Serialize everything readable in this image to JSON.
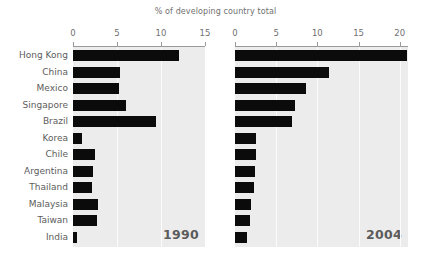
{
  "chart_data": {
    "type": "bar",
    "title": "% of developing country total",
    "xlabel": "",
    "ylabel": "",
    "orientation": "horizontal",
    "grid": true,
    "legend": "none",
    "categories": [
      "Hong Kong",
      "China",
      "Mexico",
      "Singapore",
      "Brazil",
      "Korea",
      "Chile",
      "Argentina",
      "Thailand",
      "Malaysia",
      "Taiwan",
      "India"
    ],
    "panels": [
      {
        "name": "1990",
        "label": "1990",
        "xlim": [
          0,
          15
        ],
        "ticks": [
          0,
          5,
          10,
          15
        ],
        "tick_labels": [
          "0",
          "5",
          "10",
          "15"
        ],
        "values": [
          12.1,
          5.3,
          5.2,
          6.0,
          9.4,
          1.0,
          2.5,
          2.3,
          2.2,
          2.8,
          2.7,
          0.5
        ]
      },
      {
        "name": "2004",
        "label": "2004",
        "xlim": [
          0,
          21
        ],
        "ticks": [
          0,
          5,
          10,
          15,
          20
        ],
        "tick_labels": [
          "0",
          "5",
          "10",
          "15",
          "20"
        ],
        "values": [
          20.9,
          11.4,
          8.6,
          7.3,
          6.9,
          2.6,
          2.6,
          2.4,
          2.3,
          1.9,
          1.8,
          1.5
        ]
      }
    ]
  }
}
